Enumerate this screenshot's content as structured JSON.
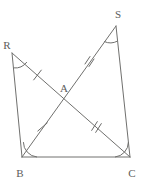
{
  "figure": {
    "stroke_color": "#70706e",
    "label_color": "#5d5d5b",
    "background": "#ffffff"
  },
  "points": {
    "R": {
      "label": "R",
      "x": 12,
      "y": 53,
      "label_x": 11,
      "label_y": 45
    },
    "S": {
      "label": "S",
      "x": 116,
      "y": 26,
      "label_x": 115,
      "label_y": 14
    },
    "B": {
      "label": "B",
      "x": 22,
      "y": 157,
      "label_x": 23,
      "label_y": 172
    },
    "C": {
      "label": "C",
      "x": 130,
      "y": 157,
      "label_x": 131,
      "label_y": 172
    },
    "A": {
      "label": "A",
      "x": 63,
      "y": 97,
      "label_x": 62,
      "label_y": 89
    }
  },
  "segments": [
    {
      "name": "segment-R-B",
      "from": "R",
      "to": "B",
      "ticks": 0
    },
    {
      "name": "segment-B-C",
      "from": "B",
      "to": "C",
      "ticks": 0
    },
    {
      "name": "segment-S-C",
      "from": "S",
      "to": "C",
      "ticks": 0
    },
    {
      "name": "segment-R-A",
      "from": "R",
      "to": "A",
      "ticks": 1
    },
    {
      "name": "segment-A-C",
      "from": "A",
      "to": "C",
      "ticks": 2
    },
    {
      "name": "segment-B-A",
      "from": "B",
      "to": "A",
      "ticks": 1
    },
    {
      "name": "segment-A-S",
      "from": "A",
      "to": "S",
      "ticks": 2
    }
  ],
  "angle_marks": [
    {
      "name": "angle-arc-R",
      "vertex": "R"
    },
    {
      "name": "angle-arc-S",
      "vertex": "S"
    },
    {
      "name": "angle-arc-B",
      "vertex": "B"
    },
    {
      "name": "angle-arc-C",
      "vertex": "C"
    }
  ],
  "labels": {
    "R": "R",
    "S": "S",
    "B": "B",
    "C": "C",
    "A": "A"
  }
}
